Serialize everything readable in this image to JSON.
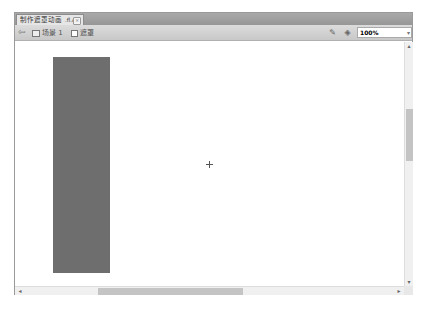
{
  "tab": {
    "title": "制作遮罩动画",
    "filename": ".fl.a",
    "close": "×"
  },
  "toolbar": {
    "back_icon": "⇦",
    "breadcrumb": [
      {
        "label": "场景 1",
        "icon": "scene-icon"
      },
      {
        "label": "遮罩",
        "icon": "symbol-icon"
      }
    ],
    "edit_scene_icon": "✎",
    "edit_symbol_icon": "◈",
    "zoom_value": "100%",
    "zoom_arrow": "▾"
  },
  "canvas": {
    "shape": {
      "type": "rectangle",
      "color": "#6e6e6e"
    },
    "registration_mark": "+"
  },
  "scrollbars": {
    "up": "▴",
    "down": "▾",
    "left": "◂",
    "right": "▸"
  }
}
